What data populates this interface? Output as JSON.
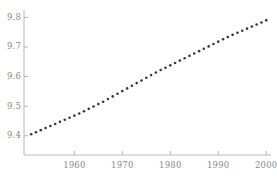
{
  "chart_data": {
    "type": "scatter",
    "title": "",
    "subtitle": "",
    "xlabel": "",
    "ylabel": "",
    "xlim": [
      1949.5,
      2001.0
    ],
    "ylim": [
      9.335,
      9.825
    ],
    "xticks": [
      1960,
      1970,
      1980,
      1990,
      2000
    ],
    "xtick_labels": [
      "1960",
      "1970",
      "1980",
      "1990",
      "2000"
    ],
    "yticks": [
      9.4,
      9.5,
      9.6,
      9.7,
      9.8
    ],
    "ytick_labels": [
      "9.4",
      "9.5",
      "9.6",
      "9.7",
      "9.8"
    ],
    "grid": false,
    "legend": null,
    "marker": "circle",
    "marker_color": "#3a3a3a",
    "marker_size": 2.6,
    "axis_color": "#b4b4b4",
    "tick_label_color": "#8a8a8a",
    "background_color": "#ffffff",
    "series": [
      {
        "name": "series-1",
        "x": [
          1951,
          1952,
          1953,
          1954,
          1955,
          1956,
          1957,
          1958,
          1959,
          1960,
          1961,
          1962,
          1963,
          1964,
          1965,
          1966,
          1967,
          1968,
          1969,
          1970,
          1971,
          1972,
          1973,
          1974,
          1975,
          1976,
          1977,
          1978,
          1979,
          1980,
          1981,
          1982,
          1983,
          1984,
          1985,
          1986,
          1987,
          1988,
          1989,
          1990,
          1991,
          1992,
          1993,
          1994,
          1995,
          1996,
          1997,
          1998,
          1999,
          2000
        ],
        "y": [
          9.405,
          9.412,
          9.419,
          9.426,
          9.433,
          9.44,
          9.447,
          9.454,
          9.461,
          9.468,
          9.475,
          9.483,
          9.491,
          9.499,
          9.507,
          9.515,
          9.524,
          9.533,
          9.542,
          9.551,
          9.56,
          9.569,
          9.578,
          9.587,
          9.596,
          9.605,
          9.614,
          9.622,
          9.63,
          9.638,
          9.646,
          9.654,
          9.662,
          9.67,
          9.678,
          9.686,
          9.694,
          9.702,
          9.71,
          9.718,
          9.726,
          9.734,
          9.741,
          9.748,
          9.755,
          9.762,
          9.769,
          9.776,
          9.783,
          9.79
        ]
      }
    ]
  },
  "geometry": {
    "plot_left": 24,
    "plot_right": 271,
    "plot_top": 10,
    "plot_bottom": 155
  }
}
